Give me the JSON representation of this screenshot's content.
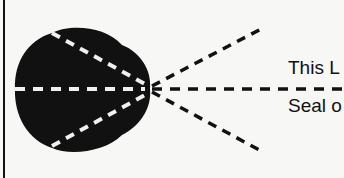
{
  "diagram": {
    "labels": {
      "top": "This L",
      "bottom": "Seal o"
    },
    "colors": {
      "shape": "#111111",
      "background": "#f7f7f5",
      "inner_dash": "#f0f0f0"
    }
  }
}
